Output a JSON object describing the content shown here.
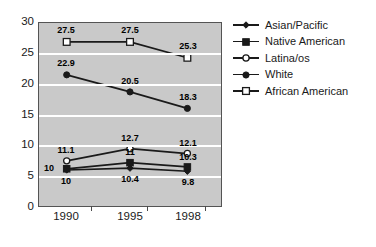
{
  "chart_data": {
    "type": "line",
    "title": "",
    "xlabel": "",
    "ylabel": "",
    "categories": [
      "1990",
      "1995",
      "1998"
    ],
    "ylim": [
      0,
      30
    ],
    "y_ticks": [
      0,
      5,
      10,
      15,
      20,
      25,
      30
    ],
    "grid": true,
    "legend_position": "right",
    "plot_background": "#c9c9c9",
    "line_color": "#1a1a1a",
    "series": [
      {
        "name": "Asian/Pacific",
        "marker": "filled-diamond",
        "values": [
          10,
          10.4,
          9.8
        ],
        "labels": [
          "10",
          "10.4",
          "9.8"
        ],
        "plotted": [
          5.9,
          6.2,
          5.7
        ],
        "label_offsets": [
          "below",
          "below",
          "below"
        ]
      },
      {
        "name": "Native American",
        "marker": "filled-square",
        "values": [
          10,
          11,
          10.3
        ],
        "labels": [
          "10",
          "11",
          "10.3"
        ],
        "plotted": [
          6.1,
          7.1,
          6.4
        ],
        "label_offsets": [
          "left",
          "above",
          "above"
        ]
      },
      {
        "name": "Latina/os",
        "marker": "open-circle",
        "values": [
          11.1,
          12.7,
          12.1
        ],
        "labels": [
          "11.1",
          "12.7",
          "12.1"
        ],
        "plotted": [
          7.4,
          9.4,
          8.6
        ],
        "label_offsets": [
          "above",
          "above",
          "above"
        ]
      },
      {
        "name": "White",
        "marker": "filled-circle",
        "values": [
          22.9,
          20.5,
          18.3
        ],
        "labels": [
          "22.9",
          "20.5",
          "18.3"
        ],
        "plotted": [
          21.5,
          18.7,
          16.0
        ],
        "label_offsets": [
          "above",
          "above",
          "above"
        ]
      },
      {
        "name": "African American",
        "marker": "open-square",
        "values": [
          27.5,
          27.5,
          25.3
        ],
        "labels": [
          "27.5",
          "27.5",
          "25.3"
        ],
        "plotted": [
          26.9,
          26.9,
          24.3
        ],
        "label_offsets": [
          "above",
          "above",
          "above"
        ]
      }
    ]
  },
  "legend": {
    "entries": [
      {
        "label": "Asian/Pacific"
      },
      {
        "label": "Native American"
      },
      {
        "label": "Latina/os"
      },
      {
        "label": "White"
      },
      {
        "label": "African American"
      }
    ]
  },
  "axis": {
    "y_labels": [
      "30",
      "25",
      "20",
      "15",
      "10",
      "5",
      "0"
    ],
    "x_labels": [
      "1990",
      "1995",
      "1998"
    ]
  }
}
